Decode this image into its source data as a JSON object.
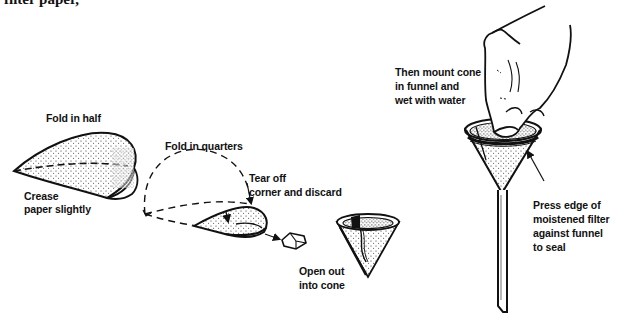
{
  "figure": {
    "header_fragment": "filter paper,",
    "colors": {
      "ink": "#111111",
      "paper_fill": "#ffffff",
      "stipple": "#2a2a2a",
      "background": "#ffffff"
    },
    "steps": [
      {
        "id": "fold-half",
        "labels": {
          "caption": "Fold in half",
          "note_line1": "Crease",
          "note_line2": "paper slightly"
        }
      },
      {
        "id": "fold-quarters",
        "labels": {
          "caption": "Fold in quarters"
        }
      },
      {
        "id": "tear-corner",
        "labels": {
          "line1": "Tear off",
          "line2": "corner and discard"
        }
      },
      {
        "id": "open-cone",
        "labels": {
          "line1": "Open out",
          "line2": "into cone"
        }
      },
      {
        "id": "mount-funnel",
        "labels": {
          "line1": "Then mount cone",
          "line2": "in funnel and",
          "line3": "wet with water"
        }
      },
      {
        "id": "press-seal",
        "labels": {
          "line1": "Press edge of",
          "line2": "moistened filter",
          "line3": "against funnel",
          "line4": "to seal"
        }
      }
    ]
  }
}
